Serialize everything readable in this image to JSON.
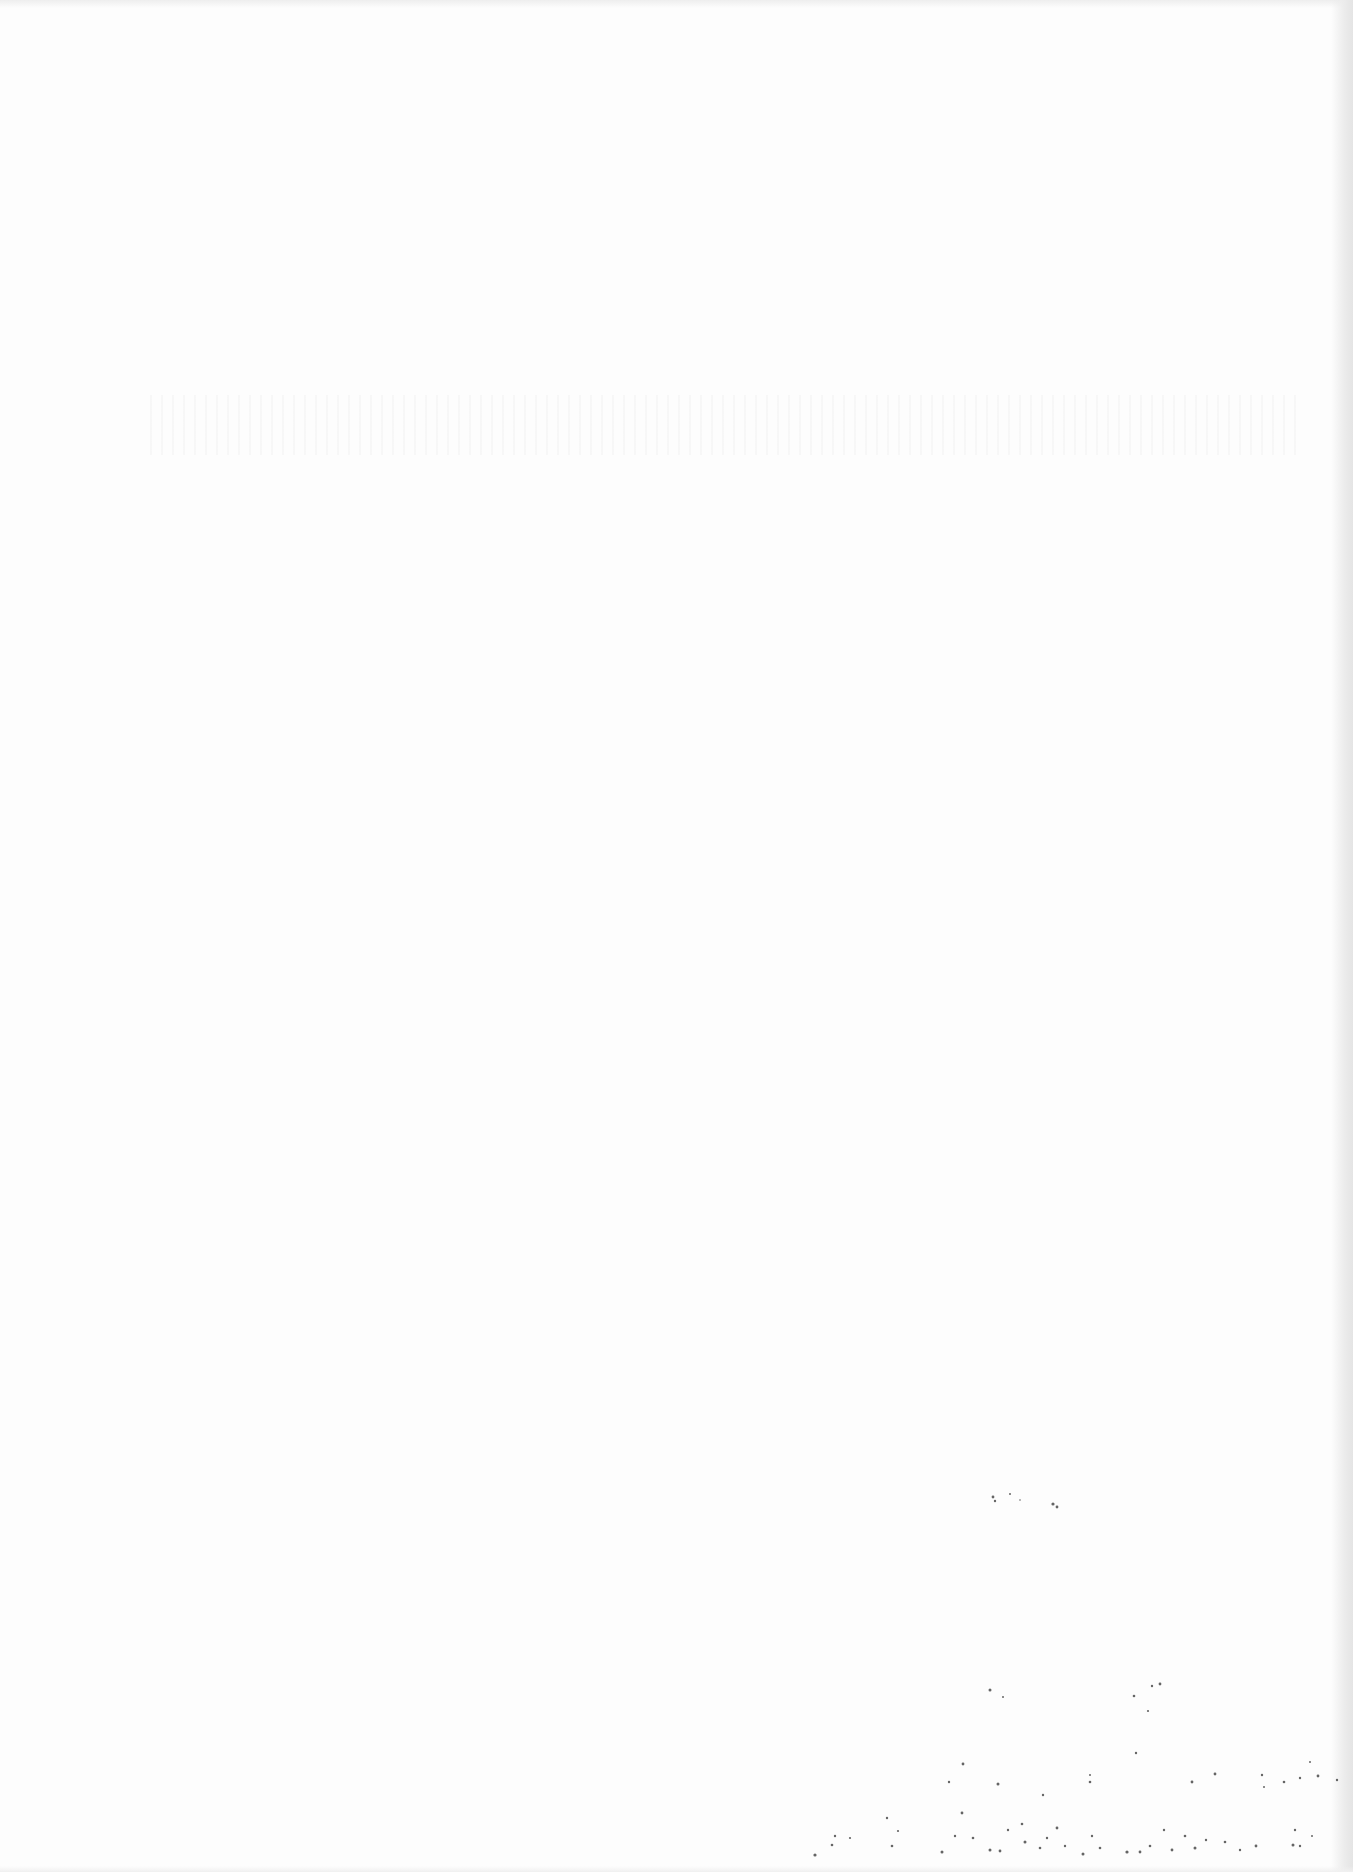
{
  "document": {
    "type": "scanned-page",
    "background_color": "#fdfdfd",
    "legible_text": []
  }
}
